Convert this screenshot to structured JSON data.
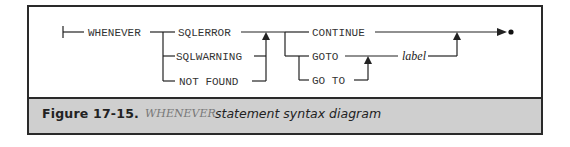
{
  "diagram": {
    "statement": "WHENEVER",
    "conditions": [
      "SQLERROR",
      "SQLWARNING",
      "NOT FOUND"
    ],
    "actions": [
      "CONTINUE",
      "GOTO",
      "GO TO"
    ],
    "target": "label"
  },
  "caption": {
    "label": "Figure  17-15.",
    "keyword": "WHENEVER",
    "text": "statement syntax diagram"
  },
  "colors": {
    "frame": "#2a2a2a",
    "caption_bg": "#cfcfcf",
    "line": "#222222"
  }
}
